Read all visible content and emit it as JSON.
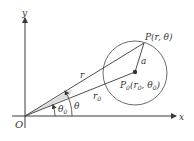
{
  "figure": {
    "type": "polar-coordinate-diagram",
    "axes": {
      "x_label": "x",
      "y_label": "y",
      "origin_label": "O"
    },
    "points": {
      "P": {
        "label": "P(r, θ)"
      },
      "P0": {
        "label_main": "P",
        "label_sub": "0",
        "label_args": "(r",
        "label_args_sub": "0",
        "label_args_mid": ", θ",
        "label_args_sub2": "0",
        "label_args_end": ")"
      }
    },
    "segments": {
      "r_label": "r",
      "r0_main": "r",
      "r0_sub": "0",
      "radius_label": "a"
    },
    "angles": {
      "theta_label": "θ",
      "theta0_main": "θ",
      "theta0_sub": "0"
    },
    "colors": {
      "line": "#3a3a3a",
      "circle": "#6b6b6b",
      "wedge": "#dcdcdc",
      "text": "#333333"
    }
  }
}
